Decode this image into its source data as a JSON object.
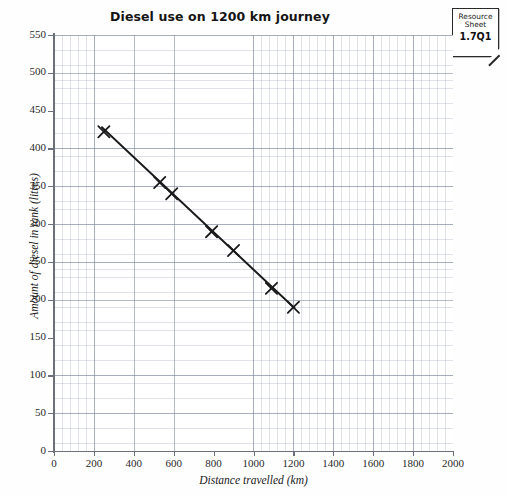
{
  "chart_data": {
    "type": "scatter",
    "title": "Diesel use on 1200 km journey",
    "xlabel": "Distance travelled (km)",
    "ylabel": "Amount of diesel in tank (litres)",
    "xlim": [
      0,
      2000
    ],
    "ylim": [
      0,
      550
    ],
    "xticks": [
      0,
      200,
      400,
      600,
      800,
      1000,
      1200,
      1400,
      1600,
      1800,
      2000
    ],
    "yticks": [
      0,
      50,
      100,
      150,
      200,
      250,
      300,
      350,
      400,
      450,
      500,
      550
    ],
    "x_major_step": 200,
    "y_major_step": 50,
    "x_minor_step": 40,
    "y_minor_step": 10,
    "grid": true,
    "legend": null,
    "marker": "x-cross",
    "marker_color": "#1a1a1a",
    "line_color": "#1a1a1a",
    "points": [
      {
        "x": 250,
        "y": 422
      },
      {
        "x": 530,
        "y": 355
      },
      {
        "x": 590,
        "y": 340
      },
      {
        "x": 790,
        "y": 290
      },
      {
        "x": 900,
        "y": 265
      },
      {
        "x": 1090,
        "y": 215
      },
      {
        "x": 1200,
        "y": 190
      }
    ],
    "trendline": {
      "label": "line of best fit",
      "x_start": 240,
      "y_start": 428,
      "x_end": 1205,
      "y_end": 189
    }
  },
  "resource_sheet": {
    "line1": "Resource",
    "line2": "Sheet",
    "code": "1.7Q1"
  }
}
